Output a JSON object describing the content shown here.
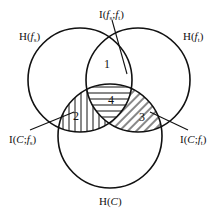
{
  "diagram": {
    "type": "venn-3-set",
    "colors": {
      "stroke": "#111111",
      "background": "#ffffff"
    },
    "sets": [
      {
        "id": "fs",
        "label": "H(f_s)",
        "label_main": "H(",
        "label_var": "f",
        "label_sub": "s",
        "label_end": ")"
      },
      {
        "id": "ft",
        "label": "H(f_t)",
        "label_main": "H(",
        "label_var": "f",
        "label_sub": "t",
        "label_end": ")"
      },
      {
        "id": "C",
        "label": "H(C)",
        "label_main": "H(",
        "label_var": "C",
        "label_sub": "",
        "label_end": ")"
      }
    ],
    "annotations": [
      {
        "id": "I_fs_ft",
        "label": "I(f_s;f_t)",
        "text_a": "I(",
        "v1": "f",
        "s1": "s",
        "sep": ";",
        "v2": "f",
        "s2": "t",
        "end": ")"
      },
      {
        "id": "I_C_fs",
        "label": "I(C;f_s)",
        "text_a": "I(",
        "v1": "C",
        "sep": ";",
        "v2": "f",
        "s2": "s",
        "end": ")"
      },
      {
        "id": "I_C_ft",
        "label": "I(C;f_t)",
        "text_a": "I(",
        "v1": "C",
        "sep": ";",
        "v2": "f",
        "s2": "t",
        "end": ")"
      }
    ],
    "regions": [
      {
        "id": "1",
        "label": "1",
        "description": "f_s ∩ f_t only"
      },
      {
        "id": "2",
        "label": "2",
        "description": "C ∩ f_s only (vertical hatch)"
      },
      {
        "id": "3",
        "label": "3",
        "description": "C ∩ f_t only (diagonal hatch)"
      },
      {
        "id": "4",
        "label": "4",
        "description": "C ∩ f_s ∩ f_t (horizontal hatch)"
      }
    ]
  }
}
